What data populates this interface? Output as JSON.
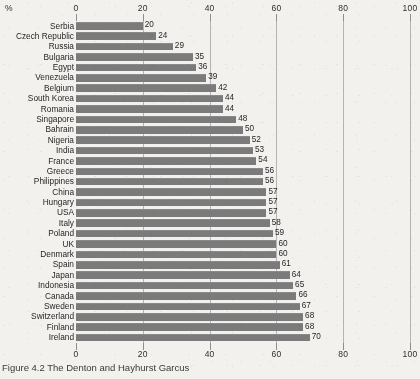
{
  "chart_data": {
    "type": "bar",
    "orientation": "horizontal",
    "title": "",
    "xlabel": "%",
    "ylabel": "",
    "xlim": [
      0,
      100
    ],
    "xticks": [
      0,
      20,
      40,
      60,
      80,
      100
    ],
    "grid": true,
    "gridlines_at": [
      20,
      40,
      60,
      80,
      100
    ],
    "axes_positions": [
      "top",
      "bottom"
    ],
    "legend": "none",
    "bar_color": "#7b7b7b",
    "value_labels": true,
    "categories": [
      "Serbia",
      "Czech Republic",
      "Russia",
      "Bulgaria",
      "Egypt",
      "Venezuela",
      "Belgium",
      "South Korea",
      "Romania",
      "Singapore",
      "Bahrain",
      "Nigeria",
      "India",
      "France",
      "Greece",
      "Philippines",
      "China",
      "Hungary",
      "USA",
      "Italy",
      "Poland",
      "UK",
      "Denmark",
      "Spain",
      "Japan",
      "Indonesia",
      "Canada",
      "Sweden",
      "Switzerland",
      "Finland",
      "Ireland"
    ],
    "values": [
      20,
      24,
      29,
      35,
      36,
      39,
      42,
      44,
      44,
      48,
      50,
      52,
      53,
      54,
      56,
      56,
      57,
      57,
      57,
      58,
      59,
      60,
      60,
      61,
      64,
      65,
      66,
      67,
      68,
      68,
      70
    ]
  },
  "axis": {
    "unit_label": "%",
    "ticks": [
      "0",
      "20",
      "40",
      "60",
      "80",
      "100"
    ]
  },
  "caption": {
    "text": "Figure 4.2  The Denton and Hayhurst Garcus"
  }
}
